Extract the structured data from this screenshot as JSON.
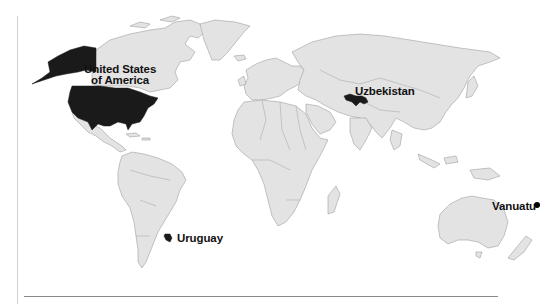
{
  "map": {
    "type": "world-locator",
    "land_color": "#e3e3e3",
    "border_color": "#9a9a9a",
    "highlight_color": "#1a1a1a",
    "highlighted_countries": [
      {
        "name": "United States of America",
        "label_line1": "United States",
        "label_line2": "of America"
      },
      {
        "name": "Uzbekistan",
        "label": "Uzbekistan"
      },
      {
        "name": "Uruguay",
        "label": "Uruguay"
      },
      {
        "name": "Vanuatu",
        "label": "Vanuatu",
        "marker": "dot"
      }
    ]
  }
}
